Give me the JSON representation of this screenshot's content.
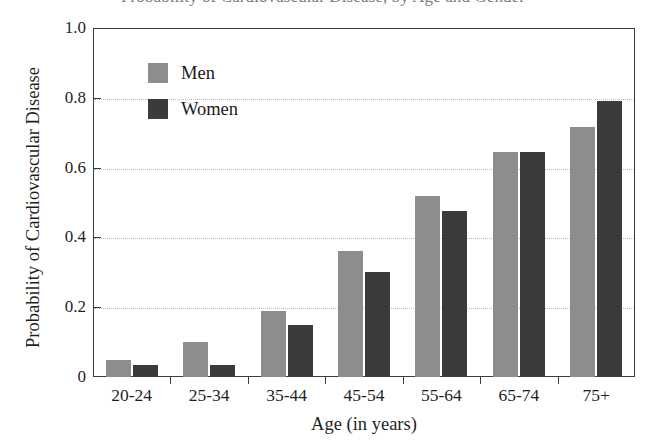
{
  "chart_data": {
    "type": "bar",
    "title_visible_fragment": "Probability of Cardiovascular Disease, by Age and Gender",
    "xlabel": "Age (in years)",
    "ylabel": "Probability of Cardiovascular Disease",
    "categories": [
      "20-24",
      "25-34",
      "35-44",
      "45-54",
      "55-64",
      "65-74",
      "75+"
    ],
    "series": [
      {
        "name": "Men",
        "color": "#8d8d8d",
        "values": [
          0.05,
          0.1,
          0.19,
          0.36,
          0.52,
          0.645,
          0.715
        ]
      },
      {
        "name": "Women",
        "color": "#3b3b3b",
        "values": [
          0.035,
          0.035,
          0.15,
          0.3,
          0.475,
          0.645,
          0.79
        ]
      }
    ],
    "ylim": [
      0,
      1.0
    ],
    "ytick_labels": [
      "0",
      "0.2",
      "0.4",
      "0.6",
      "0.8",
      "1.0"
    ],
    "ytick_values": [
      0,
      0.2,
      0.4,
      0.6,
      0.8,
      1.0
    ],
    "grid": true,
    "grid_axis": "y",
    "legend_position": "upper-left-inside",
    "legend_entries": [
      "Men",
      "Women"
    ]
  }
}
